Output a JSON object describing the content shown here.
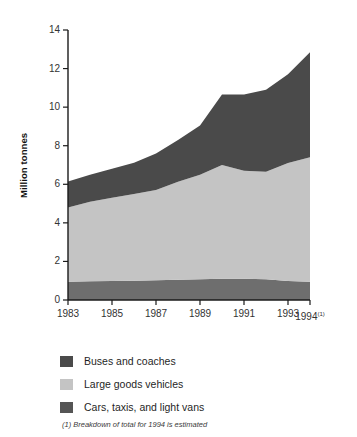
{
  "chart_data": {
    "type": "area",
    "stacked": true,
    "title": "",
    "xlabel": "",
    "ylabel": "Million tonnes",
    "ylim": [
      0,
      14
    ],
    "xlim": [
      1983,
      1994
    ],
    "ytick_values": [
      0,
      2,
      4,
      6,
      8,
      10,
      12,
      14
    ],
    "ytick_labels": [
      "0",
      "2",
      "4",
      "6",
      "8",
      "10",
      "12",
      "14"
    ],
    "xtick_values": [
      1983,
      1985,
      1987,
      1989,
      1991,
      1993,
      1994
    ],
    "xtick_labels": [
      "1983",
      "1985",
      "1987",
      "1989",
      "1991",
      "1993",
      "1994"
    ],
    "xtick_superscripts": [
      "",
      "",
      "",
      "",
      "",
      "",
      "(1)"
    ],
    "grid": false,
    "legend_position": "below",
    "x": [
      1983,
      1984,
      1985,
      1986,
      1987,
      1988,
      1989,
      1990,
      1991,
      1992,
      1993,
      1994
    ],
    "series": [
      {
        "name": "Cars, taxis, and light vans",
        "color": "#6e6e6e",
        "stack_order": 1,
        "values": [
          0.95,
          0.97,
          0.98,
          1.0,
          1.02,
          1.05,
          1.08,
          1.1,
          1.1,
          1.08,
          0.98,
          0.95
        ]
      },
      {
        "name": "Large goods vehicles",
        "color": "#c4c4c4",
        "stack_order": 2,
        "values": [
          3.85,
          4.13,
          4.32,
          4.5,
          4.68,
          5.08,
          5.42,
          5.9,
          5.6,
          5.57,
          6.12,
          6.45
        ]
      },
      {
        "name": "Buses and coaches",
        "color": "#4a4a4a",
        "stack_order": 3,
        "values": [
          1.35,
          1.4,
          1.5,
          1.62,
          1.9,
          2.17,
          2.55,
          3.65,
          3.95,
          4.25,
          4.6,
          5.45
        ]
      }
    ],
    "cumulative_totals": [
      6.15,
      6.5,
      6.8,
      7.12,
      7.6,
      8.3,
      9.05,
      10.65,
      10.65,
      10.9,
      11.7,
      12.85
    ],
    "band_upper_lower_vans": [
      0.95,
      0.97,
      0.98,
      1.0,
      1.02,
      1.05,
      1.08,
      1.1,
      1.1,
      1.08,
      0.98,
      0.95
    ],
    "band_upper_goods": [
      4.8,
      5.1,
      5.3,
      5.5,
      5.7,
      6.13,
      6.5,
      7.0,
      6.7,
      6.65,
      7.1,
      7.4
    ],
    "annotations": [
      "(1) Breakdown of total for 1994 is estimated"
    ]
  },
  "legend": {
    "items": [
      {
        "label": "Buses and coaches",
        "color": "#4a4a4a",
        "swatch_name": "legend-swatch-buses"
      },
      {
        "label": "Large goods vehicles",
        "color": "#c4c4c4",
        "swatch_name": "legend-swatch-goods"
      },
      {
        "label": "Cars, taxis, and light vans",
        "color": "#555555",
        "swatch_name": "legend-swatch-cars"
      }
    ]
  },
  "footnote": {
    "text": "(1) Breakdown of total for 1994 is estimated"
  },
  "axes": {
    "y_title": "Million tonnes",
    "axis_color": "#1a1a1a"
  }
}
